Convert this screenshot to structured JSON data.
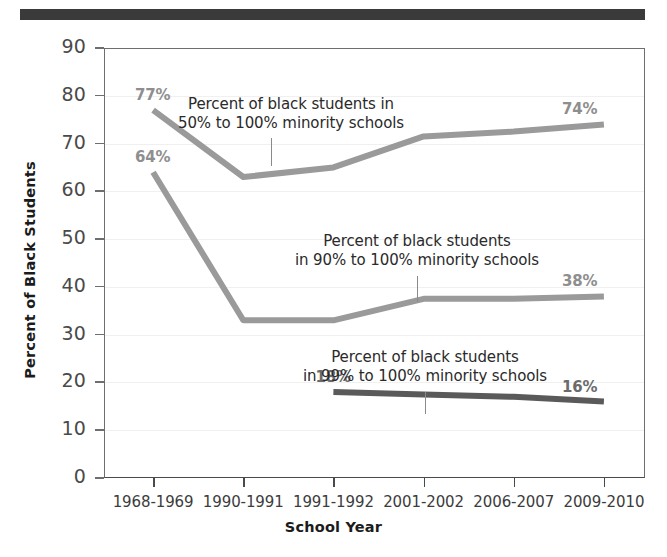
{
  "figure": {
    "top_rule_color": "#3a3a3a",
    "background": "#ffffff"
  },
  "chart_data": {
    "type": "line",
    "title": "",
    "xlabel": "School Year",
    "ylabel": "Percent of Black Students",
    "categories": [
      "1968-1969",
      "1990-1991",
      "1991-1992",
      "2001-2002",
      "2006-2007",
      "2009-2010"
    ],
    "ylim": [
      0,
      90
    ],
    "ytick_labels": [
      "0",
      "10",
      "20",
      "30",
      "40",
      "50",
      "60",
      "70",
      "80",
      "90"
    ],
    "ytick_values": [
      0,
      10,
      20,
      30,
      40,
      50,
      60,
      70,
      80,
      90
    ],
    "grid": true,
    "legend": "none",
    "series": [
      {
        "name": "Percent of black students in 50% to 100% minority schools",
        "color": "#9a9a9a",
        "x": [
          "1968-1969",
          "1990-1991",
          "1991-1992",
          "2001-2002",
          "2006-2007",
          "2009-2010"
        ],
        "values": [
          77,
          63,
          65,
          71.5,
          72.5,
          74
        ],
        "endpoint_labels": [
          {
            "text": "77%",
            "at": "1968-1969",
            "value": 77
          },
          {
            "text": "74%",
            "at": "2009-2010",
            "value": 74
          }
        ]
      },
      {
        "name": "Percent of black students in 90% to 100% minority schools",
        "color": "#9a9a9a",
        "x": [
          "1968-1969",
          "1990-1991",
          "1991-1992",
          "2001-2002",
          "2006-2007",
          "2009-2010"
        ],
        "values": [
          64,
          33,
          33,
          37.5,
          37.5,
          38
        ],
        "endpoint_labels": [
          {
            "text": "64%",
            "at": "1968-1969",
            "value": 64
          },
          {
            "text": "38%",
            "at": "2009-2010",
            "value": 38
          }
        ]
      },
      {
        "name": "Percent of black students in 99% to 100% minority schools",
        "color": "#5a5a5a",
        "x": [
          "1991-1992",
          "2001-2002",
          "2006-2007",
          "2009-2010"
        ],
        "values": [
          18,
          17.5,
          17,
          16
        ],
        "endpoint_labels": [
          {
            "text": "18%",
            "at": "1991-1992",
            "value": 18
          },
          {
            "text": "16%",
            "at": "2009-2010",
            "value": 16
          }
        ]
      }
    ],
    "annotations": [
      {
        "id": "annot-50-100",
        "line1": "Percent of black students in",
        "line2": "50% to 100% minority schools"
      },
      {
        "id": "annot-90-100",
        "line1": "Percent of black students",
        "line2": "in 90% to 100% minority schools"
      },
      {
        "id": "annot-99-100",
        "line1": "Percent of black students",
        "line2": "in 99% to 100% minority schools"
      }
    ]
  }
}
